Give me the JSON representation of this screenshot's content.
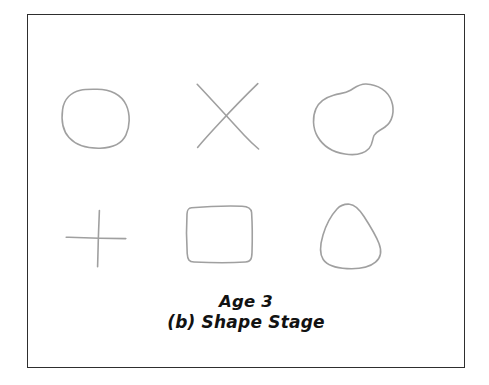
{
  "figure": {
    "caption_line_1": "Age 3",
    "caption_line_2": "(b) Shape Stage",
    "frame_color": "#2e2e2e",
    "background_color": "#ffffff",
    "stroke_color": "#a0a0a0",
    "stroke_width": 1.6
  },
  "shapes": {
    "row_top": [
      {
        "name": "circle",
        "label": "hand-drawn circle",
        "cell": {
          "x": 63,
          "y": 88,
          "width": 66,
          "height": 60
        }
      },
      {
        "name": "cross-x",
        "label": "hand-drawn X / diagonal cross",
        "cell": {
          "x": 196,
          "y": 83,
          "width": 63,
          "height": 66
        }
      },
      {
        "name": "blob",
        "label": "hand-drawn irregular blob",
        "cell": {
          "x": 313,
          "y": 83,
          "width": 80,
          "height": 72
        }
      }
    ],
    "row_bottom": [
      {
        "name": "plus",
        "label": "hand-drawn plus / cross",
        "cell": {
          "x": 66,
          "y": 210,
          "width": 60,
          "height": 57
        }
      },
      {
        "name": "square",
        "label": "hand-drawn square",
        "cell": {
          "x": 186,
          "y": 205,
          "width": 67,
          "height": 58
        }
      },
      {
        "name": "triangle",
        "label": "hand-drawn rounded triangle",
        "cell": {
          "x": 321,
          "y": 203,
          "width": 60,
          "height": 66
        }
      }
    ]
  }
}
